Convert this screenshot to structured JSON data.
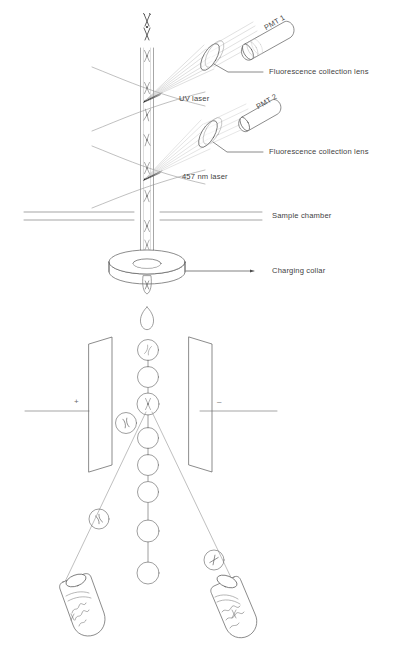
{
  "figure": {
    "background_color": "#ffffff",
    "line_color": "#5a5a5a",
    "text_color": "#3f3f3f",
    "width": 404,
    "height": 651
  },
  "labels": {
    "pmt1": "PMT 1",
    "pmt2": "PMT 2",
    "lens_top": "Fluorescence collection lens",
    "lens_bottom": "Fluorescence collection lens",
    "uv_laser": "UV laser",
    "laser_457": "457 nm laser",
    "sample_chamber": "Sample chamber",
    "charging_collar": "Charging collar",
    "plate_positive": "+",
    "plate_negative": "–"
  },
  "components": {
    "stream": {
      "name": "fluid-stream",
      "description": "vertical sample stream with chromosomes in single file"
    },
    "detectors": [
      {
        "id": "pmt1",
        "label": "PMT 1",
        "position": "upper-right"
      },
      {
        "id": "pmt2",
        "label": "PMT 2",
        "position": "middle-right"
      }
    ],
    "lenses": [
      {
        "id": "lens-top",
        "label": "Fluorescence collection lens",
        "paired_with": "pmt1"
      },
      {
        "id": "lens-bottom",
        "label": "Fluorescence collection lens",
        "paired_with": "pmt2"
      }
    ],
    "lasers": [
      {
        "id": "uv-laser",
        "label": "UV laser",
        "intersect_y": 99
      },
      {
        "id": "laser-457",
        "label": "457 nm laser",
        "intersect_y": 177
      }
    ],
    "chamber": {
      "id": "sample-chamber",
      "label": "Sample chamber"
    },
    "collar": {
      "id": "charging-collar",
      "label": "Charging collar"
    },
    "deflection_plates": [
      {
        "id": "plate-left",
        "charge": "+"
      },
      {
        "id": "plate-right",
        "charge": "–"
      }
    ],
    "collection_tubes": [
      {
        "id": "tube-left",
        "side": "left"
      },
      {
        "id": "tube-right",
        "side": "right"
      }
    ]
  }
}
